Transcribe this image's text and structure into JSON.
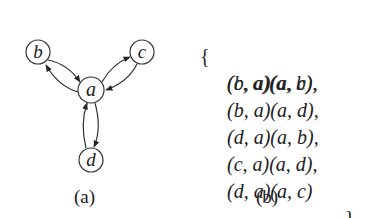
{
  "figure_a": {
    "caption": "(a)",
    "nodes": [
      {
        "id": "b",
        "label": "b",
        "x": 38,
        "y": 52
      },
      {
        "id": "c",
        "label": "c",
        "x": 142,
        "y": 52
      },
      {
        "id": "a",
        "label": "a",
        "x": 91,
        "y": 90
      },
      {
        "id": "d",
        "label": "d",
        "x": 91,
        "y": 160
      }
    ],
    "edges": [
      {
        "from": "b",
        "to": "a"
      },
      {
        "from": "a",
        "to": "b"
      },
      {
        "from": "a",
        "to": "c"
      },
      {
        "from": "c",
        "to": "a"
      },
      {
        "from": "a",
        "to": "d"
      },
      {
        "from": "d",
        "to": "a"
      }
    ]
  },
  "figure_b": {
    "caption": "(b)",
    "open_brace": "{",
    "close_brace": "}",
    "lines": [
      "(b, a)(a, c),",
      "(c, a)(a, b),",
      "(b, a)(a, d),",
      "(d, a)(a, b),",
      "(c, a)(a, d),",
      "(d, a)(a, c)"
    ]
  }
}
